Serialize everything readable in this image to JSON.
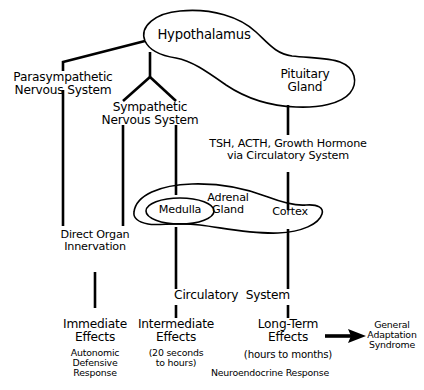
{
  "diagram": {
    "nodes": {
      "hypothalamus": "Hypothalamus",
      "pituitary": "Pituitary\nGland",
      "parasympathetic": "Parasympathetic\nNervous System",
      "sympathetic": "Sympathetic\nNervous System",
      "hormones": "TSH, ACTH, Growth Hormone\nvia Circulatory System",
      "adrenal_gland": "Adrenal\nGland",
      "medulla": "Medulla",
      "cortex": "Cortex",
      "direct_organ": "Direct Organ\nInnervation",
      "circulatory_system": "Circulatory  System",
      "immediate_effects": "Immediate\nEffects",
      "immediate_sub": "Autonomic\nDefensive\nResponse",
      "intermediate_effects": "Intermediate\nEffects",
      "intermediate_sub": "(20 seconds\nto hours)",
      "longterm_effects": "Long‐Term\nEffects",
      "longterm_sub": "(hours to months)",
      "neuroendocrine": "Neuroendocrine Response",
      "gas": "General\nAdaptation\nSyndrome"
    },
    "edges": [
      {
        "from": "hypothalamus",
        "to": "parasympathetic",
        "style": "elbow"
      },
      {
        "from": "hypothalamus",
        "to": "sympathetic",
        "style": "fork"
      },
      {
        "from": "hypothalamus",
        "to": "pituitary",
        "style": "blob-merge"
      },
      {
        "from": "parasympathetic",
        "to": "direct-organ",
        "style": "vertical"
      },
      {
        "from": "sympathetic",
        "to": "direct-organ",
        "style": "vertical"
      },
      {
        "from": "sympathetic",
        "to": "medulla",
        "style": "vertical"
      },
      {
        "from": "pituitary",
        "to": "cortex",
        "style": "vertical"
      },
      {
        "from": "direct-organ",
        "to": "immediate-effects",
        "style": "vertical"
      },
      {
        "from": "medulla",
        "to": "intermediate-effects",
        "style": "vertical"
      },
      {
        "from": "cortex",
        "to": "longterm-effects",
        "style": "vertical"
      },
      {
        "from": "longterm-effects",
        "to": "gas",
        "style": "arrow"
      }
    ],
    "colors": {
      "stroke": "#000000",
      "background": "#ffffff",
      "text": "#000000"
    }
  }
}
